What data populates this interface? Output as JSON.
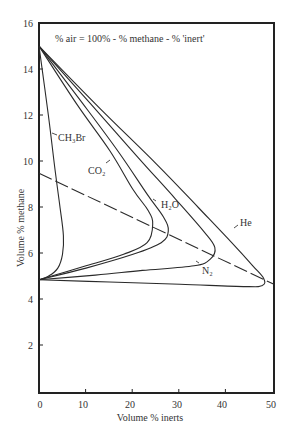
{
  "chart_data": {
    "type": "line",
    "title": "",
    "annotation": "% air = 100% - % methane - % 'inert'",
    "xlabel": "Volume % inerts",
    "ylabel": "Volume % methane",
    "xlim": [
      0,
      50
    ],
    "ylim": [
      0,
      16
    ],
    "x_ticks": [
      0,
      10,
      20,
      30,
      40,
      50
    ],
    "y_ticks": [
      2,
      4,
      6,
      8,
      10,
      12,
      14,
      16
    ],
    "grid": false,
    "legend": "inline labels",
    "series": [
      {
        "name": "CH3Br",
        "label_display": "CH₃Br",
        "points": [
          [
            0,
            15.0
          ],
          [
            2.0,
            12.0
          ],
          [
            3.5,
            9.5
          ],
          [
            4.5,
            8.0
          ],
          [
            5.2,
            6.8
          ],
          [
            5.0,
            6.0
          ],
          [
            4.0,
            5.4
          ],
          [
            2.0,
            5.05
          ],
          [
            0,
            4.9
          ]
        ]
      },
      {
        "name": "CO2",
        "label_display": "CO₂",
        "points": [
          [
            0,
            15.0
          ],
          [
            8,
            12.5
          ],
          [
            15,
            10.5
          ],
          [
            20,
            8.8
          ],
          [
            23.2,
            7.9
          ],
          [
            24.2,
            7.3
          ],
          [
            23,
            6.5
          ],
          [
            18,
            6.0
          ],
          [
            10,
            5.5
          ],
          [
            0,
            4.9
          ]
        ]
      },
      {
        "name": "H2O",
        "label_display": "H₂O",
        "points": [
          [
            0,
            15.0
          ],
          [
            9,
            12.6
          ],
          [
            17,
            10.4
          ],
          [
            23,
            8.6
          ],
          [
            26.5,
            7.6
          ],
          [
            27.5,
            7.0
          ],
          [
            26,
            6.5
          ],
          [
            20,
            6.0
          ],
          [
            10,
            5.4
          ],
          [
            0,
            4.9
          ]
        ]
      },
      {
        "name": "N2",
        "label_display": "N₂",
        "points": [
          [
            0,
            15.0
          ],
          [
            11,
            12.5
          ],
          [
            21,
            10.2
          ],
          [
            29,
            8.4
          ],
          [
            35,
            7.0
          ],
          [
            37.4,
            6.3
          ],
          [
            36.5,
            5.8
          ],
          [
            33,
            5.5
          ],
          [
            22,
            5.3
          ],
          [
            12,
            5.1
          ],
          [
            0,
            4.9
          ]
        ]
      },
      {
        "name": "He",
        "label_display": "He",
        "points": [
          [
            0,
            15.0
          ],
          [
            13,
            12.3
          ],
          [
            25,
            9.9
          ],
          [
            34,
            8.0
          ],
          [
            41,
            6.5
          ],
          [
            45.5,
            5.5
          ],
          [
            47.8,
            4.95
          ],
          [
            47.5,
            4.65
          ],
          [
            44,
            4.6
          ],
          [
            30,
            4.7
          ],
          [
            15,
            4.8
          ],
          [
            0,
            4.9
          ]
        ]
      }
    ],
    "reference_line": {
      "style": "dashed",
      "points": [
        [
          0,
          9.5
        ],
        [
          50,
          4.7
        ]
      ]
    }
  },
  "labels": {
    "annotation": "% air = 100% - % methane - % 'inert'",
    "xlabel": "Volume % inerts",
    "ylabel": "Volume % methane",
    "ch3br": "CH₃Br",
    "co2": "CO₂",
    "h2o": "H₂O",
    "n2": "N₂",
    "he": "He",
    "x_tick_0": "0",
    "x_tick_10": "10",
    "x_tick_20": "20",
    "x_tick_30": "30",
    "x_tick_40": "40",
    "x_tick_50": "50",
    "y_tick_2": "2",
    "y_tick_4": "4",
    "y_tick_6": "6",
    "y_tick_8": "8",
    "y_tick_10": "10",
    "y_tick_12": "12",
    "y_tick_14": "14",
    "y_tick_16": "16"
  }
}
